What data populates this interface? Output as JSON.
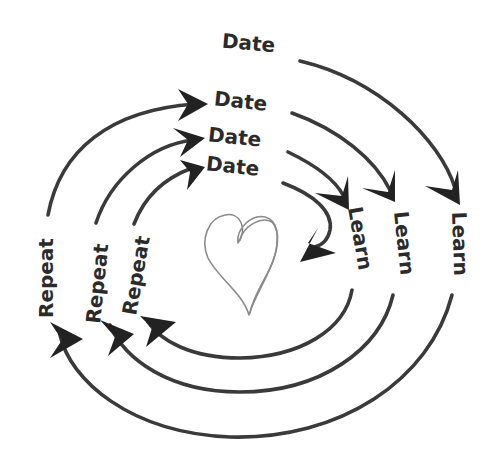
{
  "diagram": {
    "center_icon": "heart-icon",
    "colors": {
      "arrow": "#3a3a3a",
      "arrow_head": "#222222",
      "text": "#2b2b2b",
      "heart": "#8a8a8a",
      "background": "#ffffff"
    },
    "labels": {
      "date_outer": "Date",
      "date_2": "Date",
      "date_3": "Date",
      "date_inner": "Date",
      "learn_inner": "Learn",
      "learn_middle": "Learn",
      "learn_outer": "Learn",
      "repeat_outer": "Repeat",
      "repeat_middle": "Repeat",
      "repeat_inner": "Repeat"
    },
    "cycle": [
      "Date",
      "Learn",
      "Repeat"
    ],
    "rings": 3
  }
}
